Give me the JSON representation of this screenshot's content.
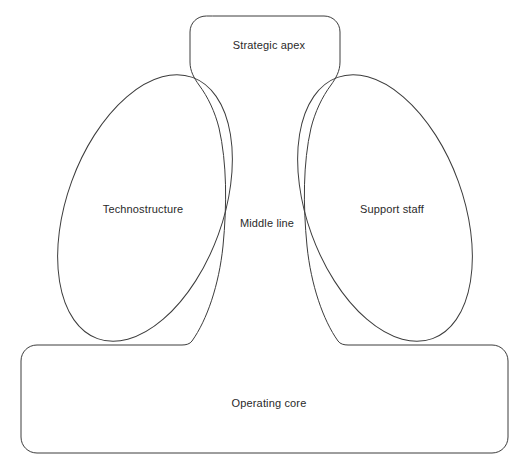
{
  "diagram": {
    "canvas": {
      "width": 528,
      "height": 467,
      "background": "#ffffff"
    },
    "stroke_color": "#3c3c3c",
    "stroke_width": 1,
    "text_color": "#2a2a2a",
    "parts": [
      {
        "id": "strategic-apex",
        "label": "Strategic apex",
        "shape": "rounded-rectangle",
        "label_x": 269,
        "label_y": 45
      },
      {
        "id": "technostructure",
        "label": "Technostructure",
        "shape": "tilted-ellipse",
        "label_x": 143,
        "label_y": 209
      },
      {
        "id": "middle-line",
        "label": "Middle line",
        "shape": "tapered-stem",
        "label_x": 267,
        "label_y": 223
      },
      {
        "id": "support-staff",
        "label": "Support staff",
        "shape": "tilted-ellipse",
        "label_x": 392,
        "label_y": 209
      },
      {
        "id": "operating-core",
        "label": "Operating core",
        "shape": "rounded-rectangle",
        "label_x": 269,
        "label_y": 403
      }
    ]
  }
}
